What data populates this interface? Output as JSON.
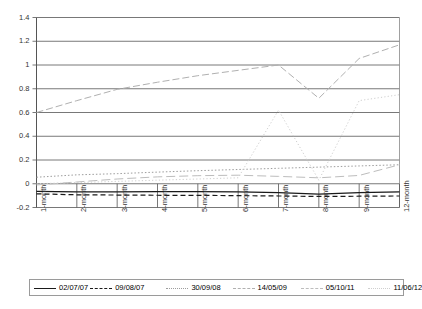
{
  "chart_data": {
    "type": "line",
    "title": "",
    "xlabel": "",
    "ylabel": "",
    "categories": [
      "1-month",
      "2-month",
      "3-month",
      "4-month",
      "5-month",
      "6-month",
      "7-month",
      "8-month",
      "9-month",
      "12-month"
    ],
    "ylim": [
      -0.2,
      1.4
    ],
    "ytick_step": 0.2,
    "yticks": [
      "1.4",
      "1.2",
      "1",
      "0.8",
      "0.6",
      "0.4",
      "0.2",
      "0",
      "-0.2"
    ],
    "ytick_values": [
      1.4,
      1.2,
      1.0,
      0.8,
      0.6,
      0.4,
      0.2,
      0.0,
      -0.2
    ],
    "grid": "horizontal",
    "legend_position": "bottom",
    "series": [
      {
        "name": "02/07/07",
        "style": "solid",
        "color": "#1a1a1a",
        "values": [
          -0.065,
          -0.068,
          -0.068,
          -0.067,
          -0.066,
          -0.068,
          -0.075,
          -0.088,
          -0.075,
          -0.068
        ]
      },
      {
        "name": "09/08/07",
        "style": "dashed",
        "color": "#1a1a1a",
        "values": [
          -0.085,
          -0.093,
          -0.095,
          -0.097,
          -0.098,
          -0.1,
          -0.103,
          -0.107,
          -0.105,
          -0.103
        ]
      },
      {
        "name": "30/09/08",
        "style": "dotted",
        "color": "#9d9d9d",
        "values": [
          0.055,
          0.075,
          0.085,
          0.098,
          0.11,
          0.12,
          0.13,
          0.14,
          0.15,
          0.16
        ]
      },
      {
        "name": "14/05/09",
        "style": "dash-dot",
        "color": "#b0b0b0",
        "values": [
          0.6,
          0.7,
          0.795,
          0.855,
          0.91,
          0.955,
          1.0,
          0.72,
          1.055,
          1.17
        ]
      },
      {
        "name": "05/10/11",
        "style": "long-dash",
        "color": "#bdbdbd",
        "values": [
          -0.01,
          0.015,
          0.04,
          0.058,
          0.068,
          0.072,
          0.062,
          0.05,
          0.07,
          0.16
        ]
      },
      {
        "name": "11/06/12",
        "style": "fine-dotted",
        "color": "#cfcfcf",
        "values": [
          0.0,
          0.01,
          0.02,
          0.03,
          0.04,
          0.05,
          0.62,
          0.03,
          0.7,
          0.75
        ]
      }
    ]
  },
  "legend": {
    "entries": [
      {
        "label": "02/07/07"
      },
      {
        "label": "09/08/07"
      },
      {
        "label": "30/09/08"
      },
      {
        "label": "14/05/09"
      },
      {
        "label": "05/10/11"
      },
      {
        "label": "11/06/12"
      }
    ]
  }
}
